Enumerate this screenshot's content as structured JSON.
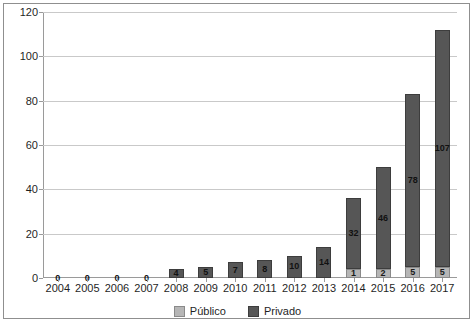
{
  "chart_data": {
    "type": "bar",
    "subtype": "stacked-bar",
    "title": "",
    "subtitle": "",
    "xlabel": "",
    "ylabel": "",
    "categories": [
      "2004",
      "2005",
      "2006",
      "2007",
      "2008",
      "2009",
      "2010",
      "2011",
      "2012",
      "2013",
      "2014",
      "2015",
      "2016",
      "2017"
    ],
    "series": [
      {
        "name": "Público",
        "color": "#b6b6b6",
        "values": [
          0,
          0,
          0,
          0,
          0,
          0,
          0,
          0,
          0,
          0,
          1,
          2,
          5,
          5
        ]
      },
      {
        "name": "Privado",
        "color": "#565656",
        "values": [
          0,
          0,
          0,
          0,
          4,
          5,
          7,
          8,
          10,
          14,
          32,
          46,
          78,
          107
        ]
      }
    ],
    "totals": [
      0,
      0,
      0,
      0,
      4,
      5,
      7,
      8,
      10,
      14,
      33,
      48,
      83,
      112
    ],
    "zero_labels": [
      "0",
      "0",
      "0",
      "0"
    ],
    "ylim": [
      0,
      120
    ],
    "yticks": [
      0,
      20,
      40,
      60,
      80,
      100,
      120
    ],
    "ytick_labels": [
      "0",
      "20",
      "40",
      "60",
      "80",
      "100",
      "120"
    ],
    "grid": true,
    "grid_axis": "y",
    "legend": {
      "position": "bottom",
      "entries": [
        {
          "label": "Público",
          "color": "#b6b6b6"
        },
        {
          "label": "Privado",
          "color": "#565656"
        }
      ]
    }
  },
  "colors": {
    "publico": "#b6b6b6",
    "privado": "#565656",
    "grid": "#c9c9c9",
    "axis": "#9a9a9a",
    "frame": "#8f8f8f",
    "text": "#1f1f1f",
    "background": "#ffffff"
  }
}
